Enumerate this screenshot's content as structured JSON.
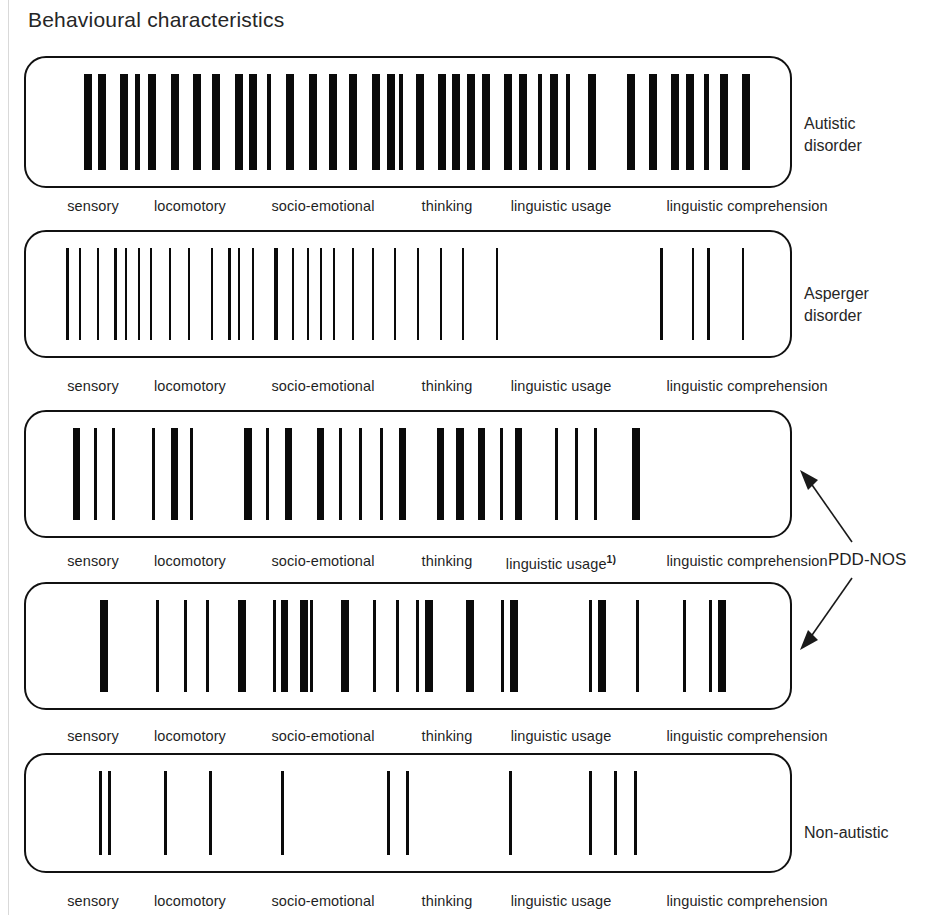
{
  "title": "Behavioural characteristics",
  "axis": {
    "labels": [
      {
        "text": "sensory",
        "x": 69
      },
      {
        "text": "locomotory",
        "x": 166
      },
      {
        "text": "socio-emotional",
        "x": 299
      },
      {
        "text": "thinking",
        "x": 423
      },
      {
        "text": "linguistic usage",
        "x": 537
      },
      {
        "text": "linguistic comprehension",
        "x": 723
      }
    ],
    "footnote_marker": "1)",
    "footnote_on_row": 2
  },
  "side_labels": {
    "autistic": "Autistic\ndisorder",
    "asperger": "Asperger\ndisorder",
    "pdd_nos": "PDD-NOS",
    "non_autistic": "Non-autistic"
  },
  "colors": {
    "bar": "#0a0a0a",
    "panel_border": "#111111",
    "text": "#1f1f1f",
    "background": "#ffffff"
  },
  "chart_data": {
    "type": "barcode",
    "title": "Behavioural characteristics",
    "xlabel": "",
    "ylabel": "",
    "categories": [
      "sensory",
      "locomotory",
      "socio-emotional",
      "thinking",
      "linguistic usage",
      "linguistic comprehension"
    ],
    "panel_geometry": {
      "left": 24,
      "width": 768,
      "note": "bar x positions below are pixel offsets from the left edge of the 768px-wide panel"
    },
    "series": [
      {
        "name": "Autistic disorder",
        "panel": {
          "top": 56,
          "height": 132
        },
        "bar_count": 44,
        "bars": [
          {
            "x": 42,
            "w": 8
          },
          {
            "x": 56,
            "w": 8
          },
          {
            "x": 78,
            "w": 8
          },
          {
            "x": 93,
            "w": 5
          },
          {
            "x": 106,
            "w": 8
          },
          {
            "x": 129,
            "w": 8
          },
          {
            "x": 151,
            "w": 8
          },
          {
            "x": 170,
            "w": 8
          },
          {
            "x": 193,
            "w": 8
          },
          {
            "x": 207,
            "w": 8
          },
          {
            "x": 225,
            "w": 4
          },
          {
            "x": 244,
            "w": 8
          },
          {
            "x": 267,
            "w": 8
          },
          {
            "x": 287,
            "w": 8
          },
          {
            "x": 307,
            "w": 8
          },
          {
            "x": 330,
            "w": 8
          },
          {
            "x": 345,
            "w": 8
          },
          {
            "x": 357,
            "w": 4
          },
          {
            "x": 374,
            "w": 8
          },
          {
            "x": 396,
            "w": 8
          },
          {
            "x": 410,
            "w": 8
          },
          {
            "x": 425,
            "w": 8
          },
          {
            "x": 440,
            "w": 8
          },
          {
            "x": 462,
            "w": 8
          },
          {
            "x": 477,
            "w": 8
          },
          {
            "x": 496,
            "w": 4
          },
          {
            "x": 508,
            "w": 8
          },
          {
            "x": 524,
            "w": 4
          },
          {
            "x": 546,
            "w": 8
          },
          {
            "x": 585,
            "w": 8
          },
          {
            "x": 607,
            "w": 8
          },
          {
            "x": 629,
            "w": 8
          },
          {
            "x": 644,
            "w": 8
          },
          {
            "x": 662,
            "w": 5
          },
          {
            "x": 678,
            "w": 8
          },
          {
            "x": 700,
            "w": 8
          }
        ]
      },
      {
        "name": "Asperger disorder",
        "panel": {
          "top": 230,
          "height": 128
        },
        "bar_count": 29,
        "bars": [
          {
            "x": 24,
            "w": 3
          },
          {
            "x": 37,
            "w": 2
          },
          {
            "x": 55,
            "w": 2
          },
          {
            "x": 72,
            "w": 3
          },
          {
            "x": 83,
            "w": 2
          },
          {
            "x": 96,
            "w": 2
          },
          {
            "x": 108,
            "w": 2
          },
          {
            "x": 127,
            "w": 2
          },
          {
            "x": 146,
            "w": 2
          },
          {
            "x": 169,
            "w": 2
          },
          {
            "x": 186,
            "w": 3
          },
          {
            "x": 196,
            "w": 2
          },
          {
            "x": 210,
            "w": 2
          },
          {
            "x": 232,
            "w": 4
          },
          {
            "x": 250,
            "w": 2
          },
          {
            "x": 265,
            "w": 2
          },
          {
            "x": 278,
            "w": 2
          },
          {
            "x": 291,
            "w": 2
          },
          {
            "x": 310,
            "w": 2
          },
          {
            "x": 330,
            "w": 2
          },
          {
            "x": 352,
            "w": 2
          },
          {
            "x": 375,
            "w": 2
          },
          {
            "x": 398,
            "w": 2
          },
          {
            "x": 420,
            "w": 2
          },
          {
            "x": 454,
            "w": 2
          },
          {
            "x": 618,
            "w": 3
          },
          {
            "x": 650,
            "w": 2
          },
          {
            "x": 665,
            "w": 3
          },
          {
            "x": 700,
            "w": 2
          }
        ]
      },
      {
        "name": "PDD-NOS (variant 1)",
        "panel": {
          "top": 410,
          "height": 128
        },
        "bar_count": 25,
        "bars": [
          {
            "x": 31,
            "w": 7
          },
          {
            "x": 52,
            "w": 3
          },
          {
            "x": 70,
            "w": 3
          },
          {
            "x": 110,
            "w": 3
          },
          {
            "x": 129,
            "w": 7
          },
          {
            "x": 148,
            "w": 3
          },
          {
            "x": 202,
            "w": 8
          },
          {
            "x": 224,
            "w": 3
          },
          {
            "x": 243,
            "w": 7
          },
          {
            "x": 275,
            "w": 7
          },
          {
            "x": 297,
            "w": 3
          },
          {
            "x": 317,
            "w": 3
          },
          {
            "x": 338,
            "w": 3
          },
          {
            "x": 357,
            "w": 7
          },
          {
            "x": 395,
            "w": 7
          },
          {
            "x": 414,
            "w": 8
          },
          {
            "x": 436,
            "w": 7
          },
          {
            "x": 458,
            "w": 3
          },
          {
            "x": 473,
            "w": 7
          },
          {
            "x": 513,
            "w": 3
          },
          {
            "x": 533,
            "w": 3
          },
          {
            "x": 552,
            "w": 3
          },
          {
            "x": 590,
            "w": 8
          }
        ]
      },
      {
        "name": "PDD-NOS (variant 2)",
        "panel": {
          "top": 582,
          "height": 128
        },
        "bar_count": 24,
        "bars": [
          {
            "x": 58,
            "w": 8
          },
          {
            "x": 114,
            "w": 3
          },
          {
            "x": 142,
            "w": 3
          },
          {
            "x": 164,
            "w": 3
          },
          {
            "x": 196,
            "w": 8
          },
          {
            "x": 231,
            "w": 3
          },
          {
            "x": 239,
            "w": 7
          },
          {
            "x": 258,
            "w": 8
          },
          {
            "x": 268,
            "w": 3
          },
          {
            "x": 299,
            "w": 8
          },
          {
            "x": 331,
            "w": 3
          },
          {
            "x": 354,
            "w": 3
          },
          {
            "x": 374,
            "w": 3
          },
          {
            "x": 383,
            "w": 8
          },
          {
            "x": 424,
            "w": 8
          },
          {
            "x": 459,
            "w": 3
          },
          {
            "x": 468,
            "w": 8
          },
          {
            "x": 547,
            "w": 3
          },
          {
            "x": 556,
            "w": 8
          },
          {
            "x": 594,
            "w": 3
          },
          {
            "x": 641,
            "w": 3
          },
          {
            "x": 667,
            "w": 3
          },
          {
            "x": 676,
            "w": 8
          }
        ]
      },
      {
        "name": "Non-autistic",
        "panel": {
          "top": 753,
          "height": 120
        },
        "bar_count": 11,
        "bars": [
          {
            "x": 57,
            "w": 3
          },
          {
            "x": 66,
            "w": 3
          },
          {
            "x": 122,
            "w": 3
          },
          {
            "x": 167,
            "w": 3
          },
          {
            "x": 239,
            "w": 3
          },
          {
            "x": 345,
            "w": 3
          },
          {
            "x": 364,
            "w": 3
          },
          {
            "x": 467,
            "w": 3
          },
          {
            "x": 547,
            "w": 3
          },
          {
            "x": 572,
            "w": 3
          },
          {
            "x": 592,
            "w": 3
          }
        ]
      }
    ]
  }
}
